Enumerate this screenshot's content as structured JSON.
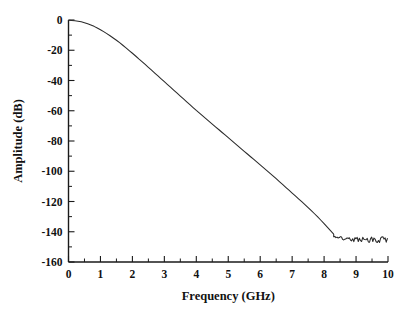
{
  "chart_data": {
    "type": "line",
    "title": "",
    "subtitle": "",
    "xlabel": "Frequency (GHz)",
    "ylabel": "Amplitude (dB)",
    "xlim": [
      0,
      10
    ],
    "ylim": [
      -160,
      0
    ],
    "grid": false,
    "legend": null,
    "legend_position": "none",
    "x_ticks": [
      0,
      1,
      2,
      3,
      4,
      5,
      6,
      7,
      8,
      9,
      10
    ],
    "x_tick_labels": [
      "0",
      "1",
      "2",
      "3",
      "4",
      "5",
      "6",
      "7",
      "8",
      "9",
      "10"
    ],
    "x_minor_tick_step": 0.5,
    "y_ticks": [
      0,
      -20,
      -40,
      -60,
      -80,
      -100,
      -120,
      -140,
      -160
    ],
    "y_tick_labels": [
      "0",
      "-20",
      "-40",
      "-60",
      "-80",
      "-100",
      "-120",
      "-140",
      "-160"
    ],
    "y_minor_tick_step": 10,
    "line_color": "#2a2a2a",
    "background_color": "#ffffff",
    "axis_color": "#1a1a1a",
    "spines": [
      "left",
      "bottom"
    ],
    "series": [
      {
        "name": "filter-response",
        "x": [
          0.0,
          0.1,
          0.2,
          0.3,
          0.4,
          0.5,
          0.6,
          0.7,
          0.8,
          0.9,
          1.0,
          1.1,
          1.2,
          1.3,
          1.4,
          1.5,
          1.6,
          1.7,
          1.8,
          1.9,
          2.0,
          2.1,
          2.2,
          2.3,
          2.4,
          2.5,
          2.6,
          2.7,
          2.8,
          2.9,
          3.0,
          3.1,
          3.2,
          3.3,
          3.4,
          3.5,
          3.6,
          3.7,
          3.8,
          3.9,
          4.0,
          4.1,
          4.2,
          4.3,
          4.4,
          4.5,
          4.6,
          4.7,
          4.8,
          4.9,
          5.0,
          5.1,
          5.2,
          5.3,
          5.4,
          5.5,
          5.6,
          5.7,
          5.8,
          5.9,
          6.0,
          6.1,
          6.2,
          6.3,
          6.4,
          6.5,
          6.6,
          6.7,
          6.8,
          6.9,
          7.0,
          7.1,
          7.2,
          7.3,
          7.4,
          7.5,
          7.6,
          7.7,
          7.8,
          7.9,
          8.0,
          8.1,
          8.2,
          8.3,
          8.4,
          8.5,
          8.6,
          8.7,
          8.8,
          8.9,
          9.0,
          9.1,
          9.2,
          9.3,
          9.4,
          9.5,
          9.6,
          9.7,
          9.8,
          9.9,
          10.0
        ],
        "y": [
          -0.2,
          -0.3,
          -0.5,
          -0.8,
          -1.2,
          -1.8,
          -2.5,
          -3.3,
          -4.2,
          -5.3,
          -6.4,
          -7.7,
          -9.0,
          -10.4,
          -11.9,
          -13.4,
          -15.0,
          -16.7,
          -18.4,
          -20.2,
          -22.0,
          -23.8,
          -25.7,
          -27.5,
          -29.4,
          -31.3,
          -33.2,
          -35.1,
          -37.0,
          -38.9,
          -40.8,
          -42.7,
          -44.6,
          -46.5,
          -48.4,
          -50.3,
          -52.2,
          -54.1,
          -56.0,
          -57.9,
          -59.8,
          -61.6,
          -63.4,
          -65.2,
          -67.0,
          -68.8,
          -70.6,
          -72.4,
          -74.2,
          -76.0,
          -77.8,
          -79.6,
          -81.4,
          -83.2,
          -85.0,
          -86.8,
          -88.6,
          -90.4,
          -92.2,
          -94.0,
          -95.8,
          -97.6,
          -99.4,
          -101.2,
          -103.0,
          -104.9,
          -106.8,
          -108.7,
          -110.6,
          -112.5,
          -114.4,
          -116.3,
          -118.2,
          -120.1,
          -122.0,
          -124.0,
          -126.0,
          -128.1,
          -130.2,
          -132.4,
          -134.6,
          -136.9,
          -139.2,
          -141.5,
          -143.4,
          -144.8,
          -146.6,
          -148.2,
          -151.0,
          -146.5,
          -155.0,
          -148.0,
          -158.5,
          -150.5,
          -153.0,
          -147.5,
          -157.5,
          -149.5,
          -154.5,
          -148.5,
          -152.0
        ],
        "noise_floor_start_ghz": 8.3,
        "noise_floor_range_db": [
          -160,
          -143
        ]
      }
    ],
    "annotations": []
  }
}
